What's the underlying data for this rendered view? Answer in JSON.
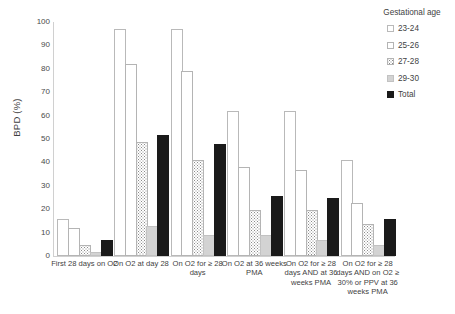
{
  "chart_data": {
    "type": "bar",
    "title": "",
    "xlabel": "",
    "ylabel": "BPD (%)",
    "ylim": [
      0,
      100
    ],
    "yticks": [
      100,
      90,
      80,
      70,
      60,
      50,
      40,
      30,
      20,
      10,
      0
    ],
    "grid": false,
    "legend_position": "right",
    "legend_title": "Gestational age",
    "categories": [
      "First 28 days on O2",
      "On O2 at day 28",
      "On O2 for ≥ 28 days",
      "On O2 at 36 weeks PMA",
      "On O2 for ≥ 28 days AND at 36 weeks PMA",
      "On O2 for ≥ 28 days AND on O2 ≥ 30% or PPV at 36 weeks PMA"
    ],
    "series": [
      {
        "name": "23-24",
        "values": [
          15,
          96,
          96,
          61,
          61,
          40
        ]
      },
      {
        "name": "25-26",
        "values": [
          11,
          81,
          78,
          37,
          36,
          22
        ]
      },
      {
        "name": "27-28",
        "values": [
          4,
          48,
          40,
          19,
          19,
          13
        ]
      },
      {
        "name": "29-30",
        "values": [
          1,
          12,
          8,
          8,
          6,
          4
        ]
      },
      {
        "name": "Total",
        "values": [
          6,
          51,
          47,
          25,
          24,
          15
        ]
      }
    ],
    "colors": {
      "23-24": "#ffffff",
      "25-26": "#ededed",
      "27-28": "#e2e2e2",
      "29-30": "#d3d3d3",
      "Total": "#1a1a1a",
      "axis": "#d0d0d0",
      "text": "#3f3f3f"
    }
  },
  "legend": {
    "title": "Gestational age",
    "items": [
      {
        "label": "23-24",
        "swatch": "sw-23"
      },
      {
        "label": "25-26",
        "swatch": "sw-25"
      },
      {
        "label": "27-28",
        "swatch": "sw-27"
      },
      {
        "label": "29-30",
        "swatch": "sw-29"
      },
      {
        "label": "Total",
        "swatch": "sw-total"
      }
    ]
  },
  "axes": {
    "y_title": "BPD (%)",
    "y_ticks": [
      "100",
      "90",
      "80",
      "70",
      "60",
      "50",
      "40",
      "30",
      "20",
      "10",
      "0"
    ],
    "x_labels": [
      "First 28 days on O2",
      "On O2 at day 28",
      "On O2 for ≥ 28 days",
      "On O2 at 36 weeks PMA",
      "On O2 for ≥ 28 days AND at 36 weeks PMA",
      "On O2 for ≥ 28 days AND on O2 ≥ 30% or PPV at 36 weeks PMA"
    ]
  }
}
